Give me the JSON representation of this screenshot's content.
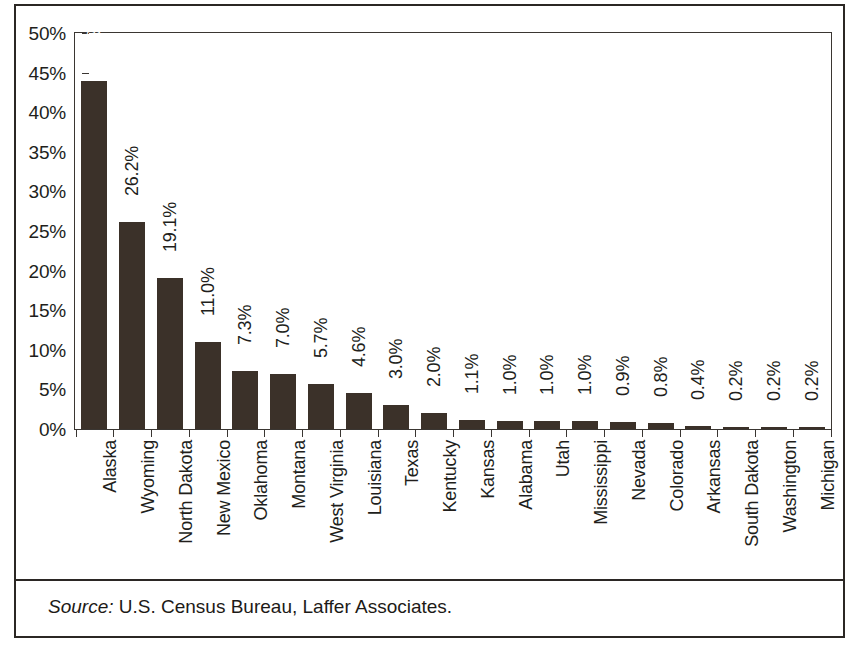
{
  "figure": {
    "source_keyword": "Source:",
    "source_text": " U.S. Census Bureau, Laffer Associates."
  },
  "colors": {
    "bar": "#3b3129",
    "axis": "#3a3632",
    "text": "#211e1b",
    "inside_label": "#ffffff",
    "frame": "#2b2724"
  },
  "chart_data": {
    "type": "bar",
    "title": "",
    "subtitle": "",
    "xlabel": "",
    "ylabel": "",
    "ylim": [
      0,
      50
    ],
    "ytick_values": [
      0,
      5,
      10,
      15,
      20,
      25,
      30,
      35,
      40,
      45,
      50
    ],
    "ytick_labels": [
      "0%",
      "5%",
      "10%",
      "15%",
      "20%",
      "25%",
      "30%",
      "35%",
      "40%",
      "45%",
      "50%"
    ],
    "grid": false,
    "legend": null,
    "value_suffix": "%",
    "categories": [
      "Alaska",
      "Wyoming",
      "North Dakota",
      "New Mexico",
      "Oklahoma",
      "Montana",
      "West Virginia",
      "Louisiana",
      "Texas",
      "Kentucky",
      "Kansas",
      "Alabama",
      "Utah",
      "Mississippi",
      "Nevada",
      "Colorado",
      "Arkansas",
      "South Dakota",
      "Washington",
      "Michigan"
    ],
    "values": [
      44.0,
      26.2,
      19.1,
      11.0,
      7.3,
      7.0,
      5.7,
      4.6,
      3.0,
      2.0,
      1.1,
      1.0,
      1.0,
      1.0,
      0.9,
      0.8,
      0.4,
      0.2,
      0.2,
      0.2
    ],
    "value_labels": [
      "44.0%",
      "26.2%",
      "19.1%",
      "11.0%",
      "7.3%",
      "7.0%",
      "5.7%",
      "4.6%",
      "3.0%",
      "2.0%",
      "1.1%",
      "1.0%",
      "1.0%",
      "1.0%",
      "0.9%",
      "0.8%",
      "0.4%",
      "0.2%",
      "0.2%",
      "0.2%"
    ],
    "label_placement": [
      "inside",
      "outside",
      "outside",
      "outside",
      "outside",
      "outside",
      "outside",
      "outside",
      "outside",
      "outside",
      "outside",
      "outside",
      "outside",
      "outside",
      "outside",
      "outside",
      "outside",
      "outside",
      "outside",
      "outside"
    ]
  }
}
